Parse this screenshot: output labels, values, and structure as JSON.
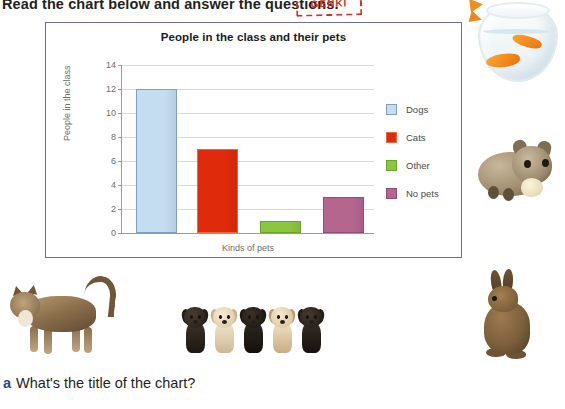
{
  "instruction": {
    "text": "Read the chart below and answer the questions.",
    "stamp_label": "GENKI"
  },
  "chart_panel": {
    "border_color": "#6a6d9e"
  },
  "chart_data": {
    "type": "bar",
    "title": "People in the class and their pets",
    "xlabel": "Kinds of pets",
    "ylabel": "People in the class",
    "categories": [
      "Dogs",
      "Cats",
      "Other",
      "No pets"
    ],
    "values": [
      12,
      7,
      1,
      3
    ],
    "colors": [
      "#c4ddf0",
      "#dd3village",
      "#8cc63f",
      "#b5668f"
    ],
    "ylim": [
      0,
      14
    ],
    "yticks": [
      0,
      2,
      4,
      6,
      8,
      10,
      12,
      14
    ],
    "grid": true,
    "legend_position": "right",
    "legend": [
      {
        "label": "Dogs",
        "color": "#c4ddf0",
        "border": "#7f9ec4"
      },
      {
        "label": "Cats",
        "color": "#df2a0c",
        "border": "#f1643f"
      },
      {
        "label": "Other",
        "color": "#8cc63f",
        "border": "#6aa52a"
      },
      {
        "label": "No pets",
        "color": "#b5668f",
        "border": "#8d5070"
      }
    ]
  },
  "questions": [
    {
      "letter": "a",
      "text": "What's the title of the chart?"
    }
  ],
  "photos": [
    {
      "name": "goldfish-bowl",
      "caption": "Goldfish in a bowl"
    },
    {
      "name": "hamster",
      "caption": "Hamster eating"
    },
    {
      "name": "cat",
      "caption": "Tabby cat"
    },
    {
      "name": "puppies",
      "caption": "Five puppies"
    },
    {
      "name": "rabbit",
      "caption": "Brown rabbit"
    }
  ]
}
